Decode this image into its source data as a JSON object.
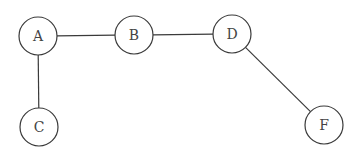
{
  "diagram": {
    "type": "undirected-graph",
    "nodes": [
      {
        "id": "A",
        "label": "A",
        "x": 38,
        "y": 36,
        "r": 19
      },
      {
        "id": "B",
        "label": "B",
        "x": 134,
        "y": 35,
        "r": 19
      },
      {
        "id": "D",
        "label": "D",
        "x": 232,
        "y": 34,
        "r": 19
      },
      {
        "id": "C",
        "label": "C",
        "x": 39,
        "y": 127,
        "r": 19
      },
      {
        "id": "F",
        "label": "F",
        "x": 324,
        "y": 125,
        "r": 19
      }
    ],
    "edges": [
      {
        "from": "A",
        "to": "B"
      },
      {
        "from": "B",
        "to": "D"
      },
      {
        "from": "A",
        "to": "C"
      },
      {
        "from": "D",
        "to": "F"
      }
    ],
    "colors": {
      "stroke": "#3a3a3a",
      "label": "#444444",
      "background": "#ffffff"
    }
  }
}
